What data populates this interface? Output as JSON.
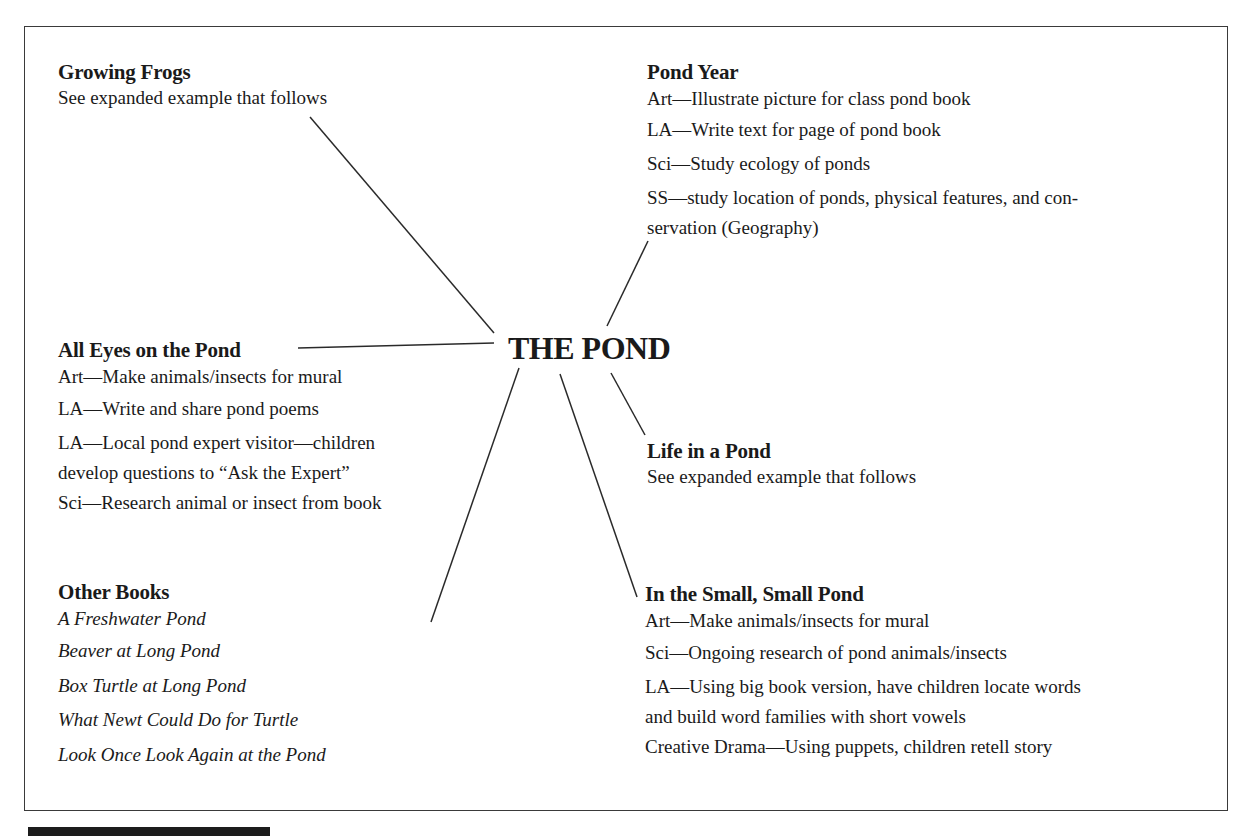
{
  "center": {
    "title": "THE POND"
  },
  "nodes": {
    "growing_frogs": {
      "title": "Growing Frogs",
      "subtitle": "See expanded example that follows"
    },
    "pond_year": {
      "title": "Pond Year",
      "items": [
        "Art—Illustrate picture for class pond  book",
        "LA—Write text for page of pond book",
        "Sci—Study ecology of ponds",
        "SS—study location of ponds, physical features, and con-",
        "servation (Geography)"
      ]
    },
    "all_eyes": {
      "title": "All Eyes on the Pond",
      "items": [
        "Art—Make animals/insects for mural",
        "LA—Write and share pond poems",
        "LA—Local pond expert visitor—children",
        "develop questions to “Ask the Expert”",
        "Sci—Research animal or insect from book"
      ]
    },
    "life_in_pond": {
      "title": "Life in a Pond",
      "subtitle": "See expanded example that follows"
    },
    "other_books": {
      "title": "Other Books",
      "books": [
        "A Freshwater Pond",
        "Beaver at Long Pond",
        "Box Turtle at Long Pond",
        "What Newt Could Do for Turtle",
        "Look Once Look Again at the Pond"
      ]
    },
    "small_pond": {
      "title": "In the Small, Small Pond",
      "items": [
        "Art—Make animals/insects for mural",
        "Sci—Ongoing research of pond animals/insects",
        "LA—Using big book version, have children locate  words",
        "and build word families with short vowels",
        "Creative Drama—Using puppets, children retell story"
      ]
    }
  },
  "colors": {
    "line": "#2a2a2a",
    "text": "#1a1a1a",
    "frame": "#3a3a3a",
    "background": "#ffffff"
  }
}
